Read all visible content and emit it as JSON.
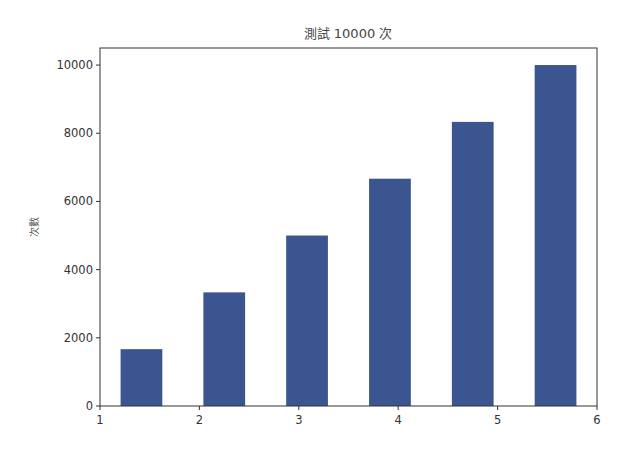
{
  "chart_data": {
    "type": "bar",
    "title": "測試 10000 次",
    "xlabel": "",
    "ylabel": "次數",
    "x": [
      1.417,
      2.25,
      3.083,
      3.917,
      4.75,
      5.583
    ],
    "values": [
      1667,
      3333,
      5000,
      6667,
      8333,
      10000
    ],
    "bar_width": 0.42,
    "xlim": [
      1,
      6
    ],
    "ylim": [
      0,
      10500
    ],
    "xticks": [
      1,
      2,
      3,
      4,
      5,
      6
    ],
    "yticks": [
      0,
      2000,
      4000,
      6000,
      8000,
      10000
    ],
    "grid": false,
    "legend": null,
    "color": "#3b5591"
  },
  "layout": {
    "plot_left": 100,
    "plot_right": 597,
    "plot_top": 48,
    "plot_bottom": 406
  }
}
